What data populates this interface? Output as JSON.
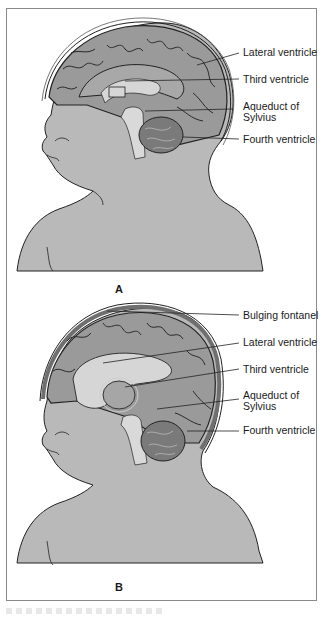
{
  "figure": {
    "panels": [
      {
        "id": "A",
        "letter": "A",
        "condition": "normal",
        "labels": {
          "lateral_ventricle": "Lateral ventricle",
          "third_ventricle": "Third ventricle",
          "aqueduct_line1": "Aqueduct of",
          "aqueduct_line2": "Sylvius",
          "fourth_ventricle": "Fourth ventricle"
        }
      },
      {
        "id": "B",
        "letter": "B",
        "condition": "enlarged-ventricles",
        "labels": {
          "bulging_fontanel": "Bulging fontanel",
          "lateral_ventricle": "Lateral ventricle",
          "third_ventricle": "Third ventricle",
          "aqueduct_line1": "Aqueduct of",
          "aqueduct_line2": "Sylvius",
          "fourth_ventricle": "Fourth ventricle"
        }
      }
    ],
    "colors": {
      "skin": "#b9b9b9",
      "brain": "#9a9a9a",
      "brain_dark": "#6f6f6f",
      "ventricle": "#d6d6d6",
      "outline": "#222222",
      "frame": "#8a8a8a"
    }
  }
}
